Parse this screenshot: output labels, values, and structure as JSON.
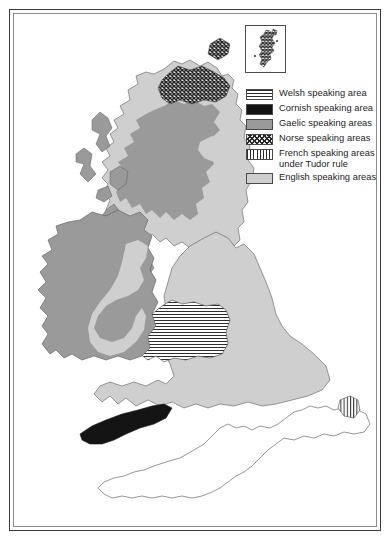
{
  "document": {
    "type": "historical-thematic-map",
    "title": "Languages of the British Isles",
    "background_color": "#ffffff",
    "frame": {
      "outer_border_color": "#3a3a3a",
      "inner_border_color": "#8c8c8c"
    }
  },
  "legend": {
    "items": [
      {
        "key": "welsh",
        "pattern": "horizontal-lines",
        "color": "#2e2e2e",
        "label": "Welsh speaking area"
      },
      {
        "key": "cornish",
        "pattern": "solid",
        "color": "#141414",
        "label": "Cornish speaking area"
      },
      {
        "key": "gaelic",
        "pattern": "solid",
        "color": "#9a9a9a",
        "label": "Gaelic speaking areas"
      },
      {
        "key": "norse",
        "pattern": "diagonal-crosshatch",
        "color": "#262626",
        "label": "Norse speaking areas"
      },
      {
        "key": "french",
        "pattern": "vertical-lines",
        "color": "#2e2e2e",
        "label": "French speaking areas\nunder Tudor rule"
      },
      {
        "key": "english",
        "pattern": "solid",
        "color": "#cfcfcf",
        "label": "English speaking areas"
      }
    ]
  },
  "inset": {
    "name": "northern-isles-inset",
    "contents": "Shetland Islands shown with Norse speaking hatching",
    "pattern": "diagonal-crosshatch"
  },
  "map_regions": [
    {
      "name": "orkney-islands",
      "legend_key": "norse",
      "country": "Scotland"
    },
    {
      "name": "caithness-sutherland",
      "legend_key": "norse",
      "country": "Scotland"
    },
    {
      "name": "scottish-highlands",
      "legend_key": "gaelic",
      "country": "Scotland"
    },
    {
      "name": "hebrides",
      "legend_key": "gaelic",
      "country": "Scotland"
    },
    {
      "name": "scottish-lowlands",
      "legend_key": "english",
      "country": "Scotland"
    },
    {
      "name": "moray-firth-coast",
      "legend_key": "english",
      "country": "Scotland"
    },
    {
      "name": "ireland-gaeltacht",
      "legend_key": "gaelic",
      "country": "Ireland"
    },
    {
      "name": "the-pale",
      "legend_key": "english",
      "country": "Ireland"
    },
    {
      "name": "isle-of-man",
      "legend_key": "gaelic",
      "country": "Isle of Man"
    },
    {
      "name": "wales",
      "legend_key": "welsh",
      "country": "Wales"
    },
    {
      "name": "england",
      "legend_key": "english",
      "country": "England"
    },
    {
      "name": "cornwall",
      "legend_key": "cornish",
      "country": "England"
    },
    {
      "name": "calais-pale",
      "legend_key": "french",
      "country": "France"
    },
    {
      "name": "northern-france",
      "legend_key": "none",
      "country": "France"
    }
  ]
}
